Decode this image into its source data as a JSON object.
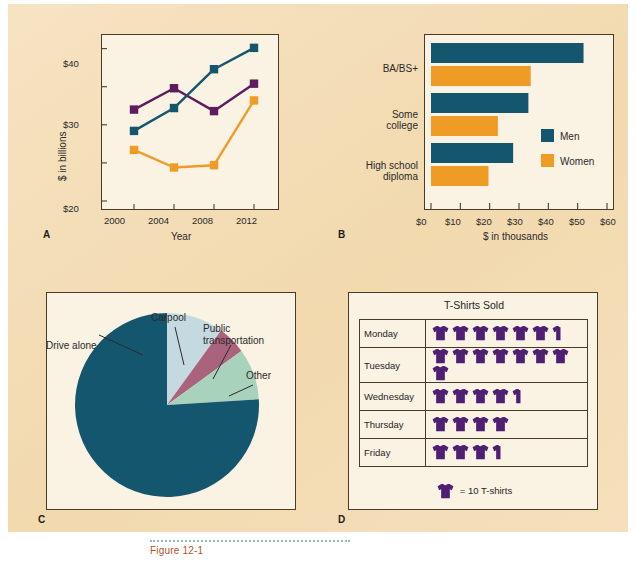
{
  "figure": {
    "background_color": "#f3dcb4",
    "plot_background_color": "#faf2e2",
    "border_color": "#4a3b28",
    "panel_letters": {
      "a": "A",
      "b": "B",
      "c": "C",
      "d": "D"
    }
  },
  "palette": {
    "teal": "#15566f",
    "orange": "#ef9c27",
    "purple": "#5e1b5e",
    "light_blue": "#c5d9e1",
    "mauve": "#a9637c",
    "sage": "#a9d2bd",
    "shirt_purple": "#4f1f73"
  },
  "chart_data": [
    {
      "id": "A",
      "type": "line",
      "title": "",
      "xlabel": "Year",
      "ylabel": "$ in billions",
      "x": [
        "2000",
        "2004",
        "2008",
        "2012"
      ],
      "xtick_labels": [
        "2000",
        "2004",
        "2008",
        "2012"
      ],
      "ytick_labels": [
        "$20",
        "$30",
        "$40"
      ],
      "ytick_values": [
        20,
        30,
        40
      ],
      "yminor_values": [
        25,
        35
      ],
      "ylim": [
        20,
        41
      ],
      "grid": false,
      "legend": "none",
      "series": [
        {
          "name": "purple-series",
          "color": "#5e1b5e",
          "values": [
            32.0,
            34.8,
            31.8,
            35.4
          ]
        },
        {
          "name": "teal-series",
          "color": "#15566f",
          "values": [
            29.2,
            32.2,
            37.3,
            40.1
          ]
        },
        {
          "name": "orange-series",
          "color": "#ef9c27",
          "values": [
            26.7,
            24.4,
            24.7,
            33.2
          ]
        }
      ]
    },
    {
      "id": "B",
      "type": "bar",
      "orientation": "horizontal",
      "title": "",
      "xlabel": "$ in thousands",
      "ylabel": "",
      "categories": [
        "BA/BS+",
        "Some college",
        "High school diploma"
      ],
      "category_label_lines": [
        [
          "BA/BS+"
        ],
        [
          "Some",
          "college"
        ],
        [
          "High school",
          "diploma"
        ]
      ],
      "xtick_labels": [
        "$0",
        "$10",
        "$20",
        "$30",
        "$40",
        "$50",
        "$60"
      ],
      "xtick_values": [
        0,
        10,
        20,
        30,
        40,
        50,
        60
      ],
      "xlim": [
        0,
        60
      ],
      "grid": false,
      "legend": {
        "position": "inside-right",
        "entries": [
          "Men",
          "Women"
        ]
      },
      "series": [
        {
          "name": "Men",
          "color": "#15566f",
          "values": [
            52.0,
            33.2,
            28.0
          ]
        },
        {
          "name": "Women",
          "color": "#ef9c27",
          "values": [
            34.0,
            22.8,
            19.6
          ]
        }
      ]
    },
    {
      "id": "C",
      "type": "pie",
      "title": "",
      "labels": [
        "Drive alone",
        "Carpool",
        "Public transportation",
        "Other"
      ],
      "values": [
        76,
        10,
        5,
        9
      ],
      "colors": [
        "#15566f",
        "#c5d9e1",
        "#a9637c",
        "#a9d2bd"
      ],
      "legend": "callout-labels"
    },
    {
      "id": "D",
      "type": "table",
      "title": "T-Shirts Sold",
      "key_label": "= 10 T-shirts",
      "unit_value": 10,
      "columns": [
        "Day",
        "T-shirts"
      ],
      "rows": [
        {
          "day": "Monday",
          "value": 65,
          "full_icons": 6,
          "half_icon": true
        },
        {
          "day": "Tuesday",
          "value": 80,
          "full_icons": 8,
          "half_icon": false
        },
        {
          "day": "Wednesday",
          "value": 45,
          "full_icons": 4,
          "half_icon": true
        },
        {
          "day": "Thursday",
          "value": 40,
          "full_icons": 4,
          "half_icon": false
        },
        {
          "day": "Friday",
          "value": 35,
          "full_icons": 3,
          "half_icon": true
        }
      ]
    }
  ],
  "caption": {
    "text": "Figure 12-1"
  }
}
